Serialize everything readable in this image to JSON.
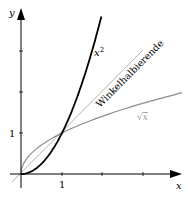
{
  "chart_data": {
    "type": "line",
    "title": "",
    "xlabel": "x",
    "ylabel": "y",
    "xlim": [
      -0.5,
      4.0
    ],
    "ylim": [
      -0.5,
      4.1
    ],
    "x_ticks": [
      1,
      2,
      3
    ],
    "y_ticks": [
      1,
      2,
      3
    ],
    "x_tick_labels": [
      "1"
    ],
    "y_tick_labels": [
      "1"
    ],
    "grid": false,
    "legend": "none (inline curve labels)",
    "series": [
      {
        "name": "x²",
        "label": "x",
        "label_sup": "2",
        "color": "#000000",
        "x": [
          0,
          0.5,
          1,
          1.5,
          1.96
        ],
        "values": [
          0,
          0.25,
          1,
          2.25,
          3.84
        ]
      },
      {
        "name": "Winkelhalbierende",
        "label": "Winkelhalbierende",
        "color": "#b4b4b4",
        "x": [
          -0.4,
          0,
          1,
          2,
          3,
          3.5
        ],
        "values": [
          -0.4,
          0,
          1,
          2,
          3,
          3.5
        ]
      },
      {
        "name": "√x",
        "label": "√x",
        "color": "#8c8c8c",
        "x": [
          0,
          0.25,
          1,
          2,
          3,
          4
        ],
        "values": [
          0,
          0.5,
          1,
          1.41,
          1.73,
          2
        ]
      }
    ],
    "annotations": [
      {
        "text": "x²",
        "near": [
          1.8,
          3.0
        ]
      },
      {
        "text": "Winkelhalbierende",
        "rotated": true,
        "angle_deg": -45
      },
      {
        "text": "√x",
        "near": [
          3.2,
          1.5
        ]
      }
    ]
  },
  "labels": {
    "x_axis": "x",
    "y_axis": "y",
    "x_tick_1": "1",
    "y_tick_1": "1",
    "x2_base": "x",
    "x2_exp": "2",
    "diag": "Winkelhalbierende",
    "sqrt_sym": "√",
    "sqrt_arg": "x"
  },
  "colors": {
    "axis": "#000000",
    "parabola": "#000000",
    "diagonal": "#b4b4b4",
    "sqrt": "#8c8c8c"
  }
}
